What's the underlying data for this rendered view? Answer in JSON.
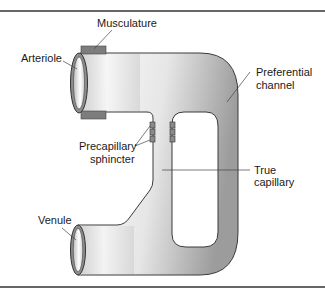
{
  "diagram": {
    "labels": {
      "musculature": "Musculature",
      "arteriole": "Arteriole",
      "preferential_line1": "Preferential",
      "preferential_line2": "channel",
      "precapillary_line1": "Precapillary",
      "precapillary_line2": "sphincter",
      "true_line1": "True",
      "true_line2": "capillary",
      "venule": "Venule"
    },
    "colors": {
      "vessel_light": "#f4f4f4",
      "vessel_dark": "#a8a8a8",
      "outline": "#3a3a3a",
      "musculature": "#7a7a7a",
      "sphincter": "#8a8a8a",
      "border": "#333333",
      "background": "#ffffff"
    }
  }
}
